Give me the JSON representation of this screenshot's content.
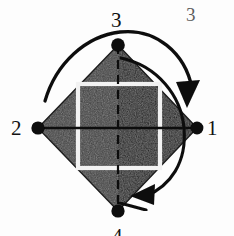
{
  "figure": {
    "caption_number": "3",
    "vertices": [
      {
        "id": "right",
        "label": "1",
        "x": 197,
        "y": 128
      },
      {
        "id": "left",
        "label": "2",
        "x": 38,
        "y": 128
      },
      {
        "id": "top",
        "label": "3",
        "x": 118,
        "y": 45
      },
      {
        "id": "bottom",
        "label": "4",
        "x": 118,
        "y": 211
      }
    ],
    "shapes": {
      "diamond_fill_left": "#3b3b3b",
      "diamond_fill_right": "#1b1b1b",
      "inner_square_stroke": "#f2f2f2",
      "axis_stroke": "#0d0d0d",
      "arc_stroke": "#101010",
      "vertex_dot_fill": "#080808",
      "background": "#fdfdfd"
    },
    "inner_square": {
      "x": 78,
      "y": 84,
      "width": 82,
      "height": 84
    },
    "arrows": [
      {
        "name": "outer-rotation-arrow",
        "direction": "clockwise",
        "head_at": "right-upper"
      },
      {
        "name": "inner-rotation-arrow",
        "direction": "clockwise",
        "head_at": "bottom-right"
      },
      {
        "name": "top-tick-arrow",
        "direction": "right",
        "head_at": "top-vertex"
      }
    ]
  }
}
